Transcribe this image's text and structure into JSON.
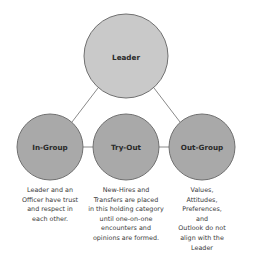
{
  "diagram": {
    "colors": {
      "leader_fill": "#c9c9c9",
      "group_fill": "#a9a9a9",
      "stroke": "#707070",
      "connector": "#8a8a8a"
    },
    "leader": {
      "label": "Leader"
    },
    "groups": [
      {
        "label": "In-Group",
        "description": "Leader and an\nOfficer have trust\nand respect in\neach other."
      },
      {
        "label": "Try-Out",
        "description": "New-Hires and\nTransfers are placed\nin this holding category\nuntil one-on-one\nencounters and\nopinions are formed."
      },
      {
        "label": "Out-Group",
        "description": "Values, Attitudes,\nPreferences, and\nOutlook do not\nalign with the\nLeader"
      }
    ]
  }
}
